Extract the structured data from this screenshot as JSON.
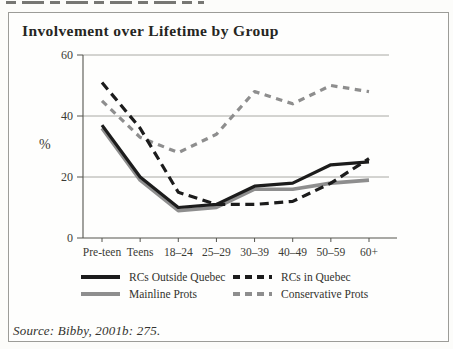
{
  "figure": {
    "title": "Involvement over Lifetime by Group",
    "source": "Source: Bibby, 2001b: 275."
  },
  "chart_data": {
    "type": "line",
    "title": "Involvement over Lifetime by Group",
    "xlabel": "",
    "ylabel": "%",
    "ylim": [
      0,
      60
    ],
    "yticks": [
      0,
      20,
      40,
      60
    ],
    "grid": "horizontal",
    "legend_position": "bottom",
    "categories": [
      "Pre-teen",
      "Teens",
      "18–24",
      "25–29",
      "30–39",
      "40–49",
      "50–59",
      "60+"
    ],
    "series": [
      {
        "name": "RCs Outside Quebec",
        "color": "#1c1c1c",
        "dashed": false,
        "values": [
          37,
          20,
          10,
          11,
          17,
          18,
          24,
          25
        ]
      },
      {
        "name": "RCs in Quebec",
        "color": "#1c1c1c",
        "dashed": true,
        "values": [
          51,
          36,
          15,
          11,
          11,
          12,
          18,
          26
        ]
      },
      {
        "name": "Mainline Prots",
        "color": "#8e8e8e",
        "dashed": false,
        "values": [
          36,
          19,
          9,
          10,
          16,
          16,
          18,
          19
        ]
      },
      {
        "name": "Conservative Prots",
        "color": "#8e8e8e",
        "dashed": true,
        "values": [
          45,
          33,
          28,
          34,
          48,
          44,
          50,
          48
        ]
      }
    ],
    "source": "Source: Bibby, 2001b: 275."
  }
}
